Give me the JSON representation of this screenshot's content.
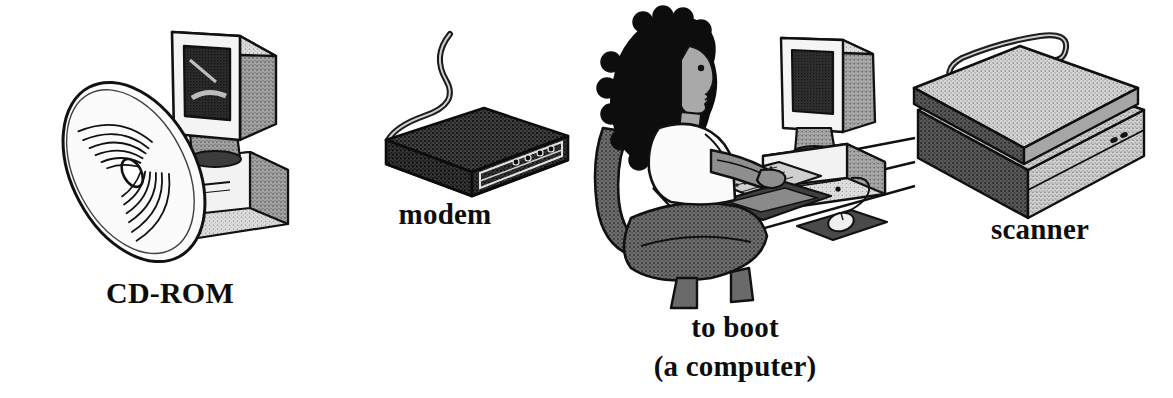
{
  "page": {
    "background_color": "#ffffff",
    "ink_color": "#0d0d0d",
    "style": "black-and-white pen-and-ink line drawings with stipple shading"
  },
  "figures": [
    {
      "id": "cd-rom",
      "label": "CD-ROM",
      "depicts": "a compact disc leaning in front of a desktop computer monitor on a CPU case",
      "label_position": "below"
    },
    {
      "id": "modem",
      "label": "modem",
      "depicts": "a dark rectangular external modem box with a cable curving up from the left and indicator lights on the front panel",
      "label_position": "below"
    },
    {
      "id": "to-boot",
      "label": "to boot",
      "sublabel": "(a computer)",
      "depicts": "a woman with curly dark hair seated in an office chair typing at a keyboard in front of a monitor, CPU and mouse on a mousepad",
      "label_position": "below"
    },
    {
      "id": "scanner",
      "label": "scanner",
      "depicts": "a light gray flatbed scanner with a hinged lid and a cable curving from the top left",
      "label_position": "below"
    }
  ],
  "colors": {
    "paper": "#ffffff",
    "ink": "#0d0d0d",
    "dark_fill": "#3a3a3a",
    "mid_gray": "#8c8c8c",
    "light_gray": "#c9c9c9",
    "screen_dark": "#2b2b2b"
  }
}
